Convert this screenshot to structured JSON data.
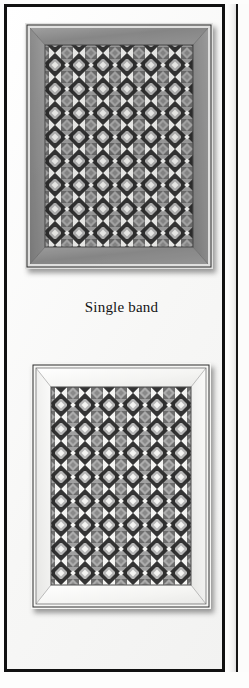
{
  "page": {
    "caption": "Single band",
    "background_color": "#fbfbfa",
    "frame_color": "#111111"
  },
  "figures": [
    {
      "id": "quilt-top",
      "name": "quilt-photograph-top",
      "position": "above-caption",
      "border_band": "dark gray solid mitered border",
      "border_color": "#8f8f8f",
      "binding_color": "#e8e8e6",
      "grid_columns": 13,
      "grid_rows": 17,
      "block_types": [
        "dark-x-block",
        "gray-square-in-square-block"
      ],
      "palette": {
        "dark": "#3a3a3a",
        "mid_dark": "#6e6e6e",
        "mid": "#909090",
        "light_gray": "#b8b8b8",
        "white": "#f4f4f2"
      }
    },
    {
      "id": "quilt-bottom",
      "name": "quilt-photograph-bottom",
      "position": "below-caption",
      "border_band": "white/light solid mitered border",
      "border_color": "#f2f2f0",
      "binding_color": "#dedede",
      "grid_columns": 13,
      "grid_rows": 17,
      "block_types": [
        "dark-x-block",
        "gray-square-in-square-block"
      ],
      "palette": {
        "dark": "#3a3a3a",
        "mid_dark": "#6e6e6e",
        "mid": "#909090",
        "light_gray": "#b8b8b8",
        "white": "#f4f4f2"
      }
    }
  ],
  "facing_page": {
    "name": "adjacent-page-sliver",
    "visible": true
  }
}
